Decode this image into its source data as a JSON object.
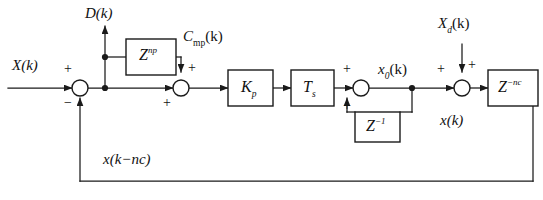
{
  "diagram": {
    "canvas": {
      "width": 543,
      "height": 200,
      "background": "#ffffff"
    },
    "line_color": "#1a1a1a",
    "signals": {
      "input": "X(k)",
      "disturbance_out": "D(k)",
      "compensation": "C",
      "compensation_sub": "mp",
      "compensation_arg": "(k)",
      "x0": "x",
      "x0_sub": "0",
      "x0_arg": "(k)",
      "xd": "X",
      "xd_sub": "d",
      "xd_arg": "(k)",
      "output": "x(k)",
      "feedback": "x(k−nc)"
    },
    "blocks": [
      {
        "id": "z-np",
        "base": "Z",
        "exponent": "np",
        "label": "Z^np"
      },
      {
        "id": "kp",
        "base": "K",
        "subscript": "p",
        "label": "K_p"
      },
      {
        "id": "ts",
        "base": "T",
        "subscript": "s",
        "label": "T_s"
      },
      {
        "id": "z-inv",
        "base": "Z",
        "exponent": "−1",
        "label": "Z^-1"
      },
      {
        "id": "z-nc",
        "base": "Z",
        "exponent": "−nc",
        "label": "Z^-nc"
      }
    ],
    "summers": [
      {
        "id": "sum-1",
        "signs": [
          "+",
          "−"
        ]
      },
      {
        "id": "sum-2",
        "signs": [
          "+",
          "+"
        ]
      },
      {
        "id": "sum-3",
        "signs": [
          "+",
          "+"
        ]
      },
      {
        "id": "sum-4",
        "signs": [
          "+",
          "+"
        ]
      }
    ],
    "signs": {
      "plus": "+",
      "minus": "−"
    }
  }
}
